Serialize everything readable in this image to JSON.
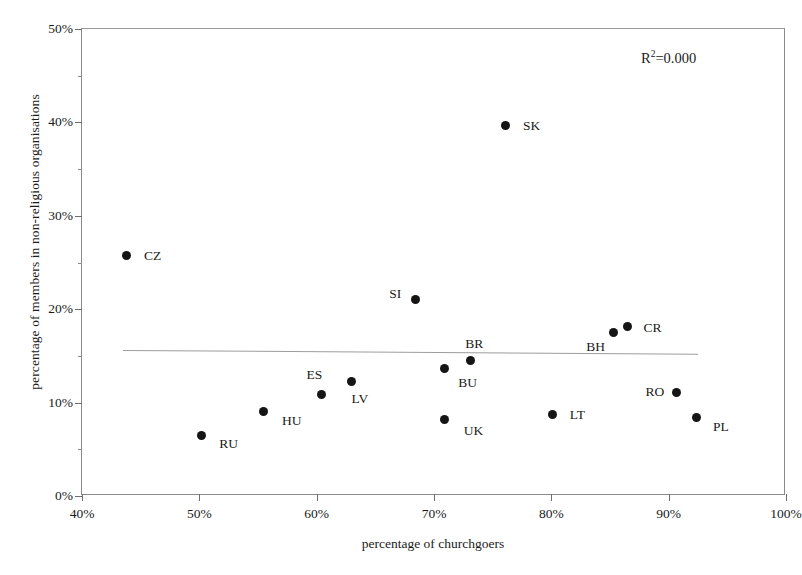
{
  "chart_data": {
    "type": "scatter",
    "title": "",
    "xlabel": "percentage of churchgoers",
    "ylabel": "percentage of members in non-religious organisations",
    "xlim": [
      40,
      100
    ],
    "ylim": [
      0,
      50
    ],
    "x_ticks": [
      "40%",
      "50%",
      "60%",
      "70%",
      "80%",
      "90%",
      "100%"
    ],
    "x_tick_values": [
      40,
      50,
      60,
      70,
      80,
      90,
      100
    ],
    "y_ticks": [
      "0%",
      "10%",
      "20%",
      "30%",
      "40%",
      "50%"
    ],
    "y_tick_values": [
      0,
      10,
      20,
      30,
      40,
      50
    ],
    "grid": false,
    "legend": "none",
    "annotation": "R2=0.000",
    "annotation_base": "R",
    "annotation_exponent": "2",
    "annotation_rest": "=0.000",
    "r_squared": 0.0,
    "trendline": {
      "type": "linear",
      "x_start": 43.5,
      "y_start": 15.6,
      "x_end": 92.5,
      "y_end": 15.2
    },
    "points": [
      {
        "label": "CZ",
        "x": 43.8,
        "y": 25.8,
        "label_dx": 26,
        "label_dy": 1
      },
      {
        "label": "RU",
        "x": 50.2,
        "y": 6.5,
        "label_dx": 27,
        "label_dy": 9
      },
      {
        "label": "HU",
        "x": 55.5,
        "y": 9.1,
        "label_dx": 28,
        "label_dy": 10
      },
      {
        "label": "ES",
        "x": 60.4,
        "y": 10.9,
        "label_dx": -7,
        "label_dy": -19
      },
      {
        "label": "LV",
        "x": 63.0,
        "y": 12.3,
        "label_dx": 8,
        "label_dy": 18
      },
      {
        "label": "SI",
        "x": 68.4,
        "y": 21.0,
        "label_dx": -20,
        "label_dy": -6
      },
      {
        "label": "BU",
        "x": 70.9,
        "y": 13.6,
        "label_dx": 23,
        "label_dy": 14
      },
      {
        "label": "UK",
        "x": 70.9,
        "y": 8.2,
        "label_dx": 29,
        "label_dy": 12
      },
      {
        "label": "BR",
        "x": 73.1,
        "y": 14.5,
        "label_dx": 4,
        "label_dy": -17
      },
      {
        "label": "SK",
        "x": 76.1,
        "y": 39.7,
        "label_dx": 26,
        "label_dy": 1
      },
      {
        "label": "LT",
        "x": 80.1,
        "y": 8.7,
        "label_dx": 25,
        "label_dy": 0
      },
      {
        "label": "BH",
        "x": 85.3,
        "y": 17.5,
        "label_dx": -18,
        "label_dy": 14
      },
      {
        "label": "CR",
        "x": 86.5,
        "y": 18.1,
        "label_dx": 25,
        "label_dy": 1
      },
      {
        "label": "RO",
        "x": 90.7,
        "y": 11.1,
        "label_dx": -22,
        "label_dy": 0
      },
      {
        "label": "PL",
        "x": 92.4,
        "y": 8.4,
        "label_dx": 24,
        "label_dy": 9
      }
    ]
  }
}
